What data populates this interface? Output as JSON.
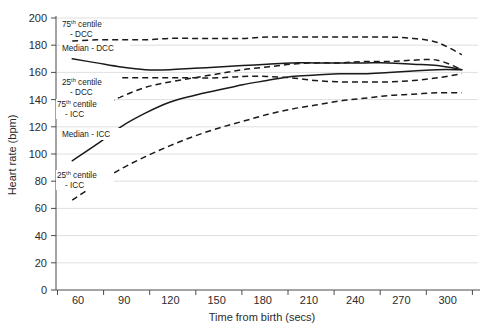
{
  "chart_data": {
    "type": "line",
    "title": "",
    "xlabel": "Time from birth (secs)",
    "ylabel": "Heart rate (bpm)",
    "xlim": [
      50,
      310
    ],
    "ylim": [
      0,
      200
    ],
    "xticks": [
      60,
      90,
      120,
      150,
      180,
      210,
      240,
      270,
      300
    ],
    "yticks": [
      0,
      20,
      40,
      60,
      80,
      100,
      120,
      140,
      160,
      180,
      200
    ],
    "grid": "horizontal",
    "legend": "inline-annotations",
    "x": [
      60,
      75,
      90,
      105,
      120,
      135,
      150,
      165,
      180,
      195,
      210,
      225,
      240,
      255,
      270,
      285,
      300
    ],
    "series": [
      {
        "name": "75th centile - DCC",
        "style": "dashed",
        "values": [
          183,
          184,
          184,
          184,
          185,
          185,
          185,
          185,
          186,
          186,
          186,
          186,
          186,
          186,
          185,
          182,
          173
        ]
      },
      {
        "name": "Median - DCC",
        "style": "solid",
        "values": [
          170,
          167,
          164,
          162,
          162,
          163,
          164,
          165,
          166,
          167,
          167,
          167,
          167,
          167,
          166,
          165,
          162
        ]
      },
      {
        "name": "25th centile - DCC",
        "style": "dashed",
        "values": [
          156,
          156,
          156,
          156,
          156,
          156,
          156,
          157,
          157,
          156,
          154,
          153,
          153,
          153,
          154,
          156,
          159
        ]
      },
      {
        "name": "75th centile - ICC",
        "style": "dashed",
        "values": [
          126,
          134,
          142,
          149,
          153,
          156,
          159,
          162,
          164,
          166,
          167,
          167,
          168,
          168,
          169,
          169,
          162
        ]
      },
      {
        "name": "Median - ICC",
        "style": "solid",
        "values": [
          95,
          107,
          120,
          130,
          138,
          143,
          147,
          151,
          154,
          157,
          158,
          159,
          159,
          160,
          161,
          162,
          162
        ]
      },
      {
        "name": "25th centile - ICC",
        "style": "dashed",
        "values": [
          66,
          78,
          89,
          98,
          106,
          113,
          119,
          124,
          129,
          133,
          136,
          139,
          141,
          143,
          144,
          145,
          145
        ]
      }
    ],
    "annotations": [
      {
        "id": "ann-p75-dcc",
        "line1_pre": "75",
        "line1_sup": "th",
        "line1_post": " centile",
        "line2": "- DCC"
      },
      {
        "id": "ann-med-dcc",
        "line1_pre": "Median - DCC",
        "line1_sup": "",
        "line1_post": "",
        "line2": ""
      },
      {
        "id": "ann-p25-dcc",
        "line1_pre": "25",
        "line1_sup": "th",
        "line1_post": " centile",
        "line2": "- DCC"
      },
      {
        "id": "ann-p75-icc",
        "line1_pre": "75",
        "line1_sup": "th",
        "line1_post": " centile",
        "line2": "- ICC"
      },
      {
        "id": "ann-med-icc",
        "line1_pre": "Median - ICC",
        "line1_sup": "",
        "line1_post": "",
        "line2": ""
      },
      {
        "id": "ann-p25-icc",
        "line1_pre": "25",
        "line1_sup": "th",
        "line1_post": " centile",
        "line2": "- ICC"
      }
    ]
  },
  "axis": {
    "y_title": "Heart rate (bpm)",
    "x_title": "Time from birth (secs)",
    "y_labels": [
      "200",
      "180",
      "160",
      "140",
      "120",
      "100",
      "80",
      "60",
      "40",
      "20",
      "0"
    ],
    "x_labels": [
      "60",
      "90",
      "120",
      "150",
      "180",
      "210",
      "240",
      "270",
      "300"
    ]
  },
  "annotations": {
    "p75_dcc_l1_pre": "75",
    "p75_dcc_l1_sup": "th",
    "p75_dcc_l1_post": " centile",
    "p75_dcc_l2": "- DCC",
    "med_dcc_l1": "Median - DCC",
    "p25_dcc_l1_pre": "25",
    "p25_dcc_l1_sup": "th",
    "p25_dcc_l1_post": " centile",
    "p25_dcc_l2": "- DCC",
    "p75_icc_l1_pre": "75",
    "p75_icc_l1_sup": "th",
    "p75_icc_l1_post": " centile",
    "p75_icc_l2": "- ICC",
    "med_icc_l1": "Median - ICC",
    "p25_icc_l1_pre": "25",
    "p25_icc_l1_sup": "th",
    "p25_icc_l1_post": " centile",
    "p25_icc_l2": "- ICC"
  },
  "colors": {
    "ink": "#1a1a1a",
    "grid": "#c9c9c9",
    "axis": "#4a4a4a",
    "background": "#ffffff"
  }
}
